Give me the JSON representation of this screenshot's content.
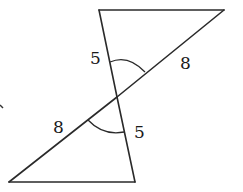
{
  "diagram": {
    "type": "two triangles sharing a vertex (vertical angles)",
    "colors": {
      "stroke": "#2a2a2a",
      "text": "#1a1a1a",
      "background": "#ffffff"
    },
    "vertices": {
      "top_left": [
        99,
        10
      ],
      "top_right": [
        224,
        10
      ],
      "intersection": [
        117,
        97
      ],
      "bottom_left": [
        9,
        182
      ],
      "bottom_right": [
        135,
        182
      ]
    },
    "labels": {
      "upper_left_side": "5",
      "upper_right_side": "8",
      "lower_left_side": "8",
      "lower_right_side": "5"
    },
    "angle_marks": [
      {
        "name": "upper-vertical-angle",
        "note": "arc marking angle at intersection, upper triangle"
      },
      {
        "name": "lower-vertical-angle",
        "note": "arc marking angle at intersection, lower triangle"
      }
    ]
  }
}
